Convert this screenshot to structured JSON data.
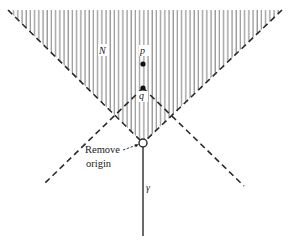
{
  "figure": {
    "labels": {
      "region": "N",
      "point_p": "p",
      "point_q": "q",
      "origin_line1": "Remove",
      "origin_line2": "origin",
      "curve": "γ"
    },
    "colors": {
      "hatch": "#7a7a7a",
      "line": "#2a2a2a",
      "background": "#ffffff"
    },
    "geometry": {
      "origin": [
        143,
        143
      ],
      "point_p": [
        143,
        64
      ],
      "point_q": [
        143,
        88
      ],
      "hatched_region_top_left": [
        8,
        10
      ],
      "hatched_region_top_right": [
        282,
        10
      ],
      "q_cone_bottom_left": [
        45,
        183
      ],
      "q_cone_bottom_right": [
        244,
        186
      ],
      "curve_end": [
        143,
        236
      ]
    }
  }
}
